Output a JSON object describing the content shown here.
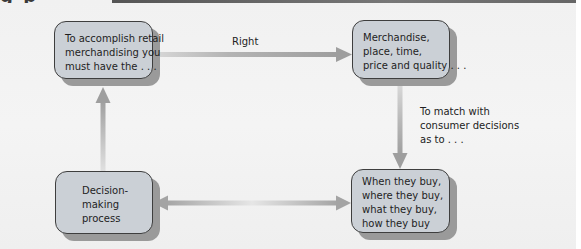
{
  "figure": {
    "heading_fragment": "g p",
    "boxes": [
      {
        "id": "top-left",
        "lines": [
          "To accomplish retail",
          "merchandising you",
          "must have the . . ."
        ]
      },
      {
        "id": "top-right",
        "lines": [
          "Merchandise,",
          "place, time,",
          "price and quality . . ."
        ]
      },
      {
        "id": "bottom-left",
        "lines": [
          "Decision-",
          "making",
          "process"
        ]
      },
      {
        "id": "bottom-right",
        "lines": [
          "When they buy,",
          "where they buy,",
          "what they buy,",
          "how they buy"
        ]
      }
    ],
    "arrows": [
      {
        "from": "top-left",
        "to": "top-right",
        "label": "Right"
      },
      {
        "from": "top-right",
        "to": "bottom-right",
        "label_lines": [
          "To match with",
          "consumer decisions",
          "as to . . ."
        ]
      },
      {
        "from": "bottom-right",
        "to": "bottom-left",
        "bidirectional": true
      },
      {
        "from": "bottom-left",
        "to": "top-left"
      }
    ],
    "colors": {
      "box_fill": "#cbd0d6",
      "box_border": "#3e3e3e",
      "box_shadow": "#9a9a9a",
      "arrow": "#a8a8a8",
      "background": "#f1f1f1"
    }
  }
}
